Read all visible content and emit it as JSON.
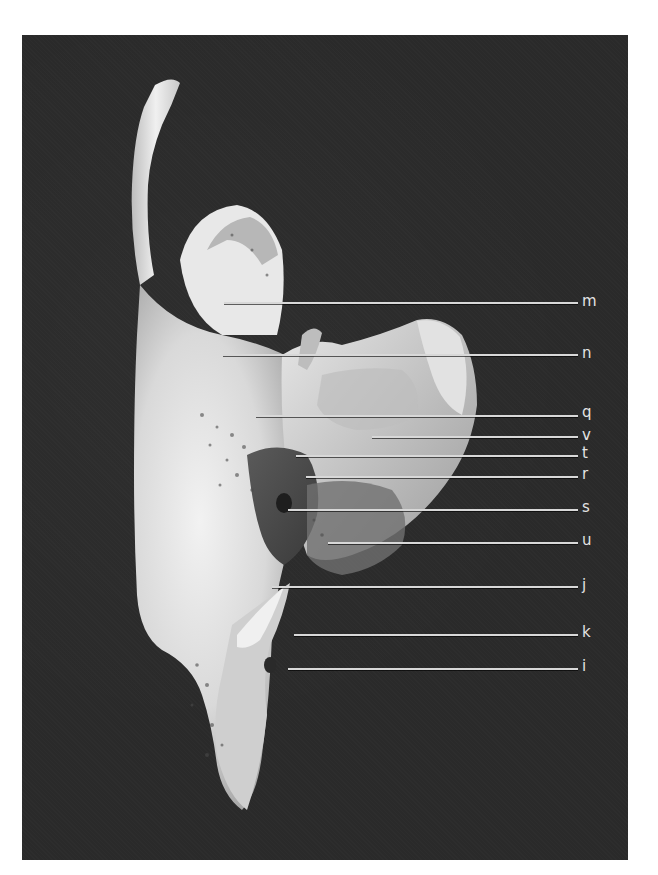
{
  "figure": {
    "background_color": "#2a2a2a",
    "page_color": "#ffffff",
    "line_color": "#d8d8d8"
  },
  "labels": [
    {
      "letter": "m",
      "y": 303,
      "x_start": 224
    },
    {
      "letter": "n",
      "y": 355,
      "x_start": 223
    },
    {
      "letter": "q",
      "y": 416,
      "x_start": 256
    },
    {
      "letter": "v",
      "y": 437,
      "x_start": 372
    },
    {
      "letter": "t",
      "y": 456,
      "x_start": 296
    },
    {
      "letter": "r",
      "y": 477,
      "x_start": 306
    },
    {
      "letter": "s",
      "y": 510,
      "x_start": 288
    },
    {
      "letter": "u",
      "y": 543,
      "x_start": 328
    },
    {
      "letter": "j",
      "y": 587,
      "x_start": 272
    },
    {
      "letter": "k",
      "y": 635,
      "x_start": 294
    },
    {
      "letter": "i",
      "y": 669,
      "x_start": 288
    }
  ]
}
